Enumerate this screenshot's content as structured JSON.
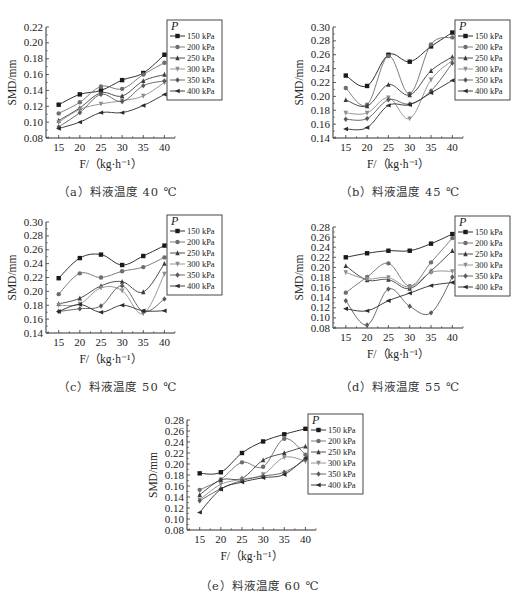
{
  "chart_data": [
    {
      "id": "a",
      "type": "line",
      "caption": "（a）料液温度 40 ℃",
      "xlabel": "F/（kg·h⁻¹）",
      "ylabel": "SMD/mm",
      "x": [
        15,
        20,
        25,
        30,
        35,
        40
      ],
      "xticks": [
        "15",
        "20",
        "25",
        "30",
        "35",
        "40"
      ],
      "ylim": [
        0.08,
        0.22
      ],
      "yticks": [
        "0.08",
        "0.10",
        "0.12",
        "0.14",
        "0.16",
        "0.18",
        "0.20",
        "0.22"
      ],
      "legend_title": "P",
      "legend_position": "upper right",
      "grid": false,
      "series": [
        {
          "name": "150 kPa",
          "values": [
            0.122,
            0.135,
            0.14,
            0.153,
            0.162,
            0.185
          ]
        },
        {
          "name": "200 kPa",
          "values": [
            0.111,
            0.125,
            0.145,
            0.142,
            0.16,
            0.175
          ]
        },
        {
          "name": "250 kPa",
          "values": [
            0.102,
            0.118,
            0.137,
            0.133,
            0.152,
            0.16
          ]
        },
        {
          "name": "300 kPa",
          "values": [
            0.1,
            0.116,
            0.123,
            0.127,
            0.133,
            0.15
          ]
        },
        {
          "name": "350 kPa",
          "values": [
            0.094,
            0.112,
            0.135,
            0.126,
            0.146,
            0.152
          ]
        },
        {
          "name": "400 kPa",
          "values": [
            0.092,
            0.1,
            0.112,
            0.112,
            0.121,
            0.135
          ]
        }
      ]
    },
    {
      "id": "b",
      "type": "line",
      "caption": "（b）料液温度 45 ℃",
      "xlabel": "F/（kg·h⁻¹）",
      "ylabel": "SMD/mm",
      "x": [
        15,
        20,
        25,
        30,
        35,
        40
      ],
      "xticks": [
        "15",
        "20",
        "25",
        "30",
        "35",
        "40"
      ],
      "ylim": [
        0.14,
        0.3
      ],
      "yticks": [
        "0.14",
        "0.16",
        "0.18",
        "0.20",
        "0.22",
        "0.24",
        "0.26",
        "0.28",
        "0.30"
      ],
      "legend_title": "P",
      "legend_position": "upper right",
      "grid": false,
      "series": [
        {
          "name": "150 kPa",
          "values": [
            0.23,
            0.215,
            0.26,
            0.25,
            0.272,
            0.292
          ]
        },
        {
          "name": "200 kPa",
          "values": [
            0.212,
            0.188,
            0.258,
            0.204,
            0.275,
            0.285
          ]
        },
        {
          "name": "250 kPa",
          "values": [
            0.195,
            0.186,
            0.217,
            0.202,
            0.237,
            0.257
          ]
        },
        {
          "name": "300 kPa",
          "values": [
            0.176,
            0.176,
            0.198,
            0.168,
            0.224,
            0.252
          ]
        },
        {
          "name": "350 kPa",
          "values": [
            0.167,
            0.168,
            0.195,
            0.189,
            0.208,
            0.248
          ]
        },
        {
          "name": "400 kPa",
          "values": [
            0.153,
            0.155,
            0.187,
            0.188,
            0.205,
            0.223
          ]
        }
      ]
    },
    {
      "id": "c",
      "type": "line",
      "caption": "（c）料液温度 50 ℃",
      "xlabel": "F/（kg·h⁻¹）",
      "ylabel": "SMD/mm",
      "x": [
        15,
        20,
        25,
        30,
        35,
        40
      ],
      "xticks": [
        "15",
        "20",
        "25",
        "30",
        "35",
        "40"
      ],
      "ylim": [
        0.14,
        0.3
      ],
      "yticks": [
        "0.14",
        "0.16",
        "0.18",
        "0.20",
        "0.22",
        "0.24",
        "0.26",
        "0.28",
        "0.30"
      ],
      "legend_title": "P",
      "legend_position": "upper right",
      "grid": false,
      "series": [
        {
          "name": "150 kPa",
          "values": [
            0.219,
            0.248,
            0.253,
            0.238,
            0.251,
            0.266
          ]
        },
        {
          "name": "200 kPa",
          "values": [
            0.196,
            0.226,
            0.22,
            0.229,
            0.235,
            0.249
          ]
        },
        {
          "name": "250 kPa",
          "values": [
            0.182,
            0.19,
            0.208,
            0.214,
            0.199,
            0.24
          ]
        },
        {
          "name": "300 kPa",
          "values": [
            0.18,
            0.182,
            0.205,
            0.201,
            0.168,
            0.225
          ]
        },
        {
          "name": "350 kPa",
          "values": [
            0.171,
            0.175,
            0.179,
            0.208,
            0.171,
            0.189
          ]
        },
        {
          "name": "400 kPa",
          "values": [
            0.171,
            0.181,
            0.17,
            0.18,
            0.172,
            0.172
          ]
        }
      ]
    },
    {
      "id": "d",
      "type": "line",
      "caption": "（d）料液温度 55 ℃",
      "xlabel": "F/（kg·h⁻¹）",
      "ylabel": "SMD/mm",
      "x": [
        15,
        20,
        25,
        30,
        35,
        40
      ],
      "xticks": [
        "15",
        "20",
        "25",
        "30",
        "35",
        "40"
      ],
      "ylim": [
        0.08,
        0.28
      ],
      "yticks": [
        "0.08",
        "0.10",
        "0.12",
        "0.14",
        "0.16",
        "0.18",
        "0.20",
        "0.22",
        "0.24",
        "0.26",
        "0.28"
      ],
      "legend_title": "P",
      "legend_position": "upper right",
      "grid": false,
      "series": [
        {
          "name": "150 kPa",
          "values": [
            0.22,
            0.228,
            0.233,
            0.233,
            0.247,
            0.266
          ]
        },
        {
          "name": "200 kPa",
          "values": [
            0.15,
            0.181,
            0.208,
            0.163,
            0.21,
            0.258
          ]
        },
        {
          "name": "250 kPa",
          "values": [
            0.203,
            0.175,
            0.176,
            0.158,
            0.193,
            0.233
          ]
        },
        {
          "name": "300 kPa",
          "values": [
            0.19,
            0.177,
            0.18,
            0.161,
            0.19,
            0.192
          ]
        },
        {
          "name": "350 kPa",
          "values": [
            0.134,
            0.086,
            0.157,
            0.123,
            0.11,
            0.181
          ]
        },
        {
          "name": "400 kPa",
          "values": [
            0.118,
            0.114,
            0.134,
            0.149,
            0.164,
            0.17
          ]
        }
      ]
    },
    {
      "id": "e",
      "type": "line",
      "caption": "（e）料液温度 60 ℃",
      "xlabel": "F/（kg·h⁻¹）",
      "ylabel": "SMD/mm",
      "x": [
        15,
        20,
        25,
        30,
        35,
        40
      ],
      "xticks": [
        "15",
        "20",
        "25",
        "30",
        "35",
        "40"
      ],
      "ylim": [
        0.08,
        0.28
      ],
      "yticks": [
        "0.08",
        "0.10",
        "0.12",
        "0.14",
        "0.16",
        "0.18",
        "0.20",
        "0.22",
        "0.24",
        "0.26",
        "0.28"
      ],
      "legend_title": "P",
      "legend_position": "upper right",
      "grid": false,
      "series": [
        {
          "name": "150 kPa",
          "values": [
            0.183,
            0.185,
            0.22,
            0.241,
            0.254,
            0.264
          ]
        },
        {
          "name": "200 kPa",
          "values": [
            0.153,
            0.172,
            0.203,
            0.195,
            0.246,
            0.217
          ]
        },
        {
          "name": "250 kPa",
          "values": [
            0.144,
            0.171,
            0.174,
            0.207,
            0.22,
            0.232
          ]
        },
        {
          "name": "300 kPa",
          "values": [
            0.135,
            0.163,
            0.172,
            0.181,
            0.212,
            0.205
          ]
        },
        {
          "name": "350 kPa",
          "values": [
            0.133,
            0.155,
            0.17,
            0.178,
            0.185,
            0.208
          ]
        },
        {
          "name": "400 kPa",
          "values": [
            0.112,
            0.154,
            0.167,
            0.175,
            0.181,
            0.211
          ]
        }
      ]
    }
  ],
  "figure": {
    "series_colors": [
      "#1a1a1a",
      "#6e6e6e",
      "#3c3c3c",
      "#8c8c8c",
      "#5a5a5a",
      "#2a2a2a"
    ],
    "markers": [
      "square",
      "circle",
      "triangle-up",
      "triangle-down",
      "diamond",
      "left-triangle"
    ]
  }
}
